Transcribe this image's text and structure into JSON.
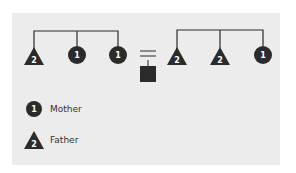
{
  "diagram": {
    "left_group": {
      "nodes": [
        {
          "shape": "triangle",
          "label": "2"
        },
        {
          "shape": "circle",
          "label": "1"
        },
        {
          "shape": "circle",
          "label": "1"
        }
      ]
    },
    "center": {
      "symbol": "equals-icon",
      "result_shape": "square"
    },
    "right_group": {
      "nodes": [
        {
          "shape": "triangle",
          "label": "2"
        },
        {
          "shape": "triangle",
          "label": "2"
        },
        {
          "shape": "circle",
          "label": "1"
        }
      ]
    }
  },
  "legend": {
    "items": [
      {
        "shape": "circle",
        "number": "1",
        "label": "Mother"
      },
      {
        "shape": "triangle",
        "number": "2",
        "label": "Father"
      }
    ]
  },
  "colors": {
    "panel": "#ececec",
    "shape": "#2b2b2b",
    "text": "#333333"
  }
}
